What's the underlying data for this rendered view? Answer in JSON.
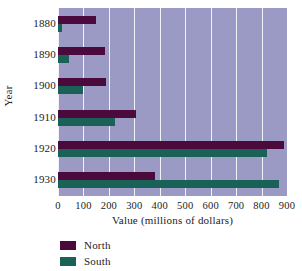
{
  "chart_data": {
    "type": "bar",
    "orientation": "horizontal",
    "title": "",
    "xlabel": "Value (millions of dollars)",
    "ylabel": "Year",
    "categories": [
      "1880",
      "1890",
      "1900",
      "1910",
      "1920",
      "1930"
    ],
    "xticks": [
      "0",
      "100",
      "200",
      "300",
      "400",
      "500",
      "600",
      "700",
      "800",
      "900"
    ],
    "xlim": [
      0,
      900
    ],
    "grid": "vertical",
    "legend_position": "below-left",
    "series": [
      {
        "name": "North",
        "color": "#4a0a3c",
        "values": [
          150,
          185,
          190,
          305,
          890,
          380
        ]
      },
      {
        "name": "South",
        "color": "#1a6257",
        "values": [
          15,
          45,
          100,
          225,
          820,
          870
        ]
      }
    ],
    "plot_background": "#9b9ac4",
    "gridline_color": "#f2f1f7"
  },
  "legend": {
    "items": [
      {
        "label": "North",
        "color": "#4a0a3c"
      },
      {
        "label": "South",
        "color": "#1a6257"
      }
    ]
  }
}
